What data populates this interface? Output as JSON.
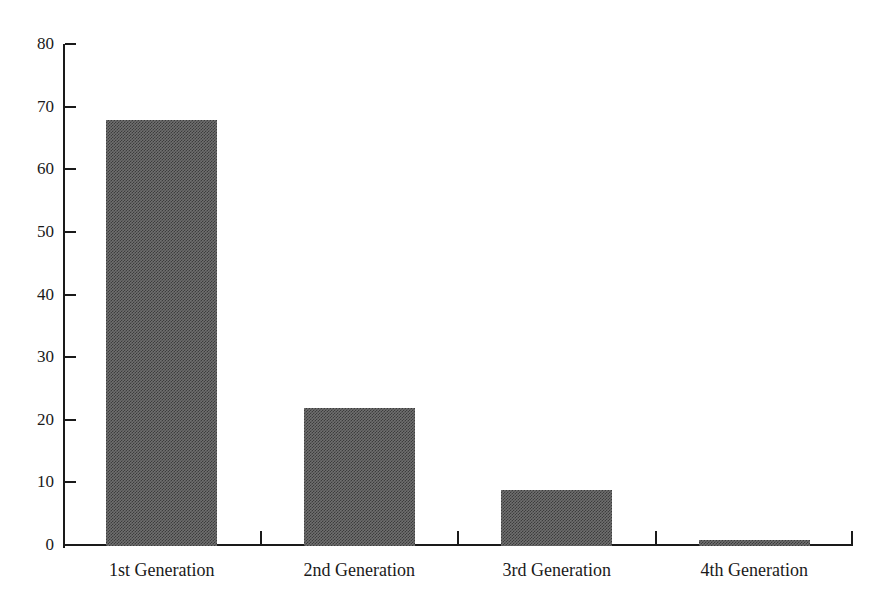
{
  "chart_data": {
    "type": "bar",
    "title": "",
    "subtitle": "",
    "xlabel": "",
    "ylabel": "",
    "categories": [
      "1st Generation",
      "2nd Generation",
      "3rd Generation",
      "4th Generation"
    ],
    "values": [
      68,
      22,
      9,
      1
    ],
    "ylim": [
      0,
      80
    ],
    "ytick_labels": [
      "0",
      "10",
      "20",
      "30",
      "40",
      "50",
      "60",
      "70",
      "80"
    ],
    "ytick_values": [
      0,
      10,
      20,
      30,
      40,
      50,
      60,
      70,
      80
    ],
    "grid": false,
    "legend": null,
    "legend_position": "none",
    "bar_color": "#6f6f6f",
    "axis_color": "#1a1a1a",
    "background_color": "#ffffff",
    "annotations": []
  },
  "axes": {
    "y_axis_name": "y-axis",
    "x_axis_name": "x-axis"
  }
}
